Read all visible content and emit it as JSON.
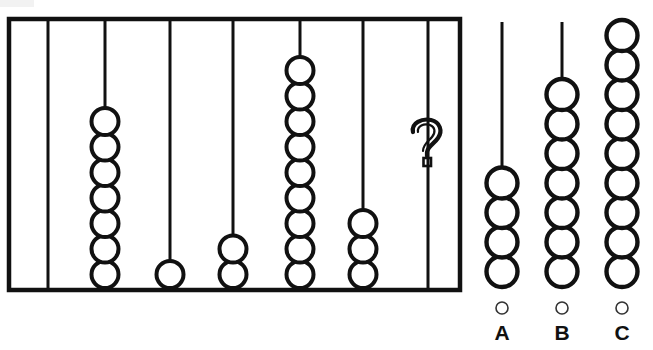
{
  "puzzle": {
    "type": "abacus-sequence-pattern",
    "question_mark": "?"
  },
  "main_frame": {
    "name": "abacus-frame",
    "border_color": "#111111",
    "rods": [
      {
        "id": "rod-1",
        "label": "1",
        "beads": 0,
        "has_question": false
      },
      {
        "id": "rod-2",
        "label": "2",
        "beads": 7,
        "has_question": false
      },
      {
        "id": "rod-3",
        "label": "3",
        "beads": 1,
        "has_question": false
      },
      {
        "id": "rod-4",
        "label": "4",
        "beads": 2,
        "has_question": false
      },
      {
        "id": "rod-5",
        "label": "5",
        "beads": 9,
        "has_question": false
      },
      {
        "id": "rod-6",
        "label": "6",
        "beads": 3,
        "has_question": false
      },
      {
        "id": "rod-7",
        "label": "7",
        "beads": 0,
        "has_question": true
      }
    ]
  },
  "options": [
    {
      "id": "option-a",
      "letter": "A",
      "beads": 4,
      "selected": false
    },
    {
      "id": "option-b",
      "letter": "B",
      "beads": 7,
      "selected": false
    },
    {
      "id": "option-c",
      "letter": "C",
      "beads": 9,
      "selected": false
    }
  ],
  "colors": {
    "ink": "#111111",
    "background": "#ffffff",
    "radio_outline": "#333333"
  }
}
